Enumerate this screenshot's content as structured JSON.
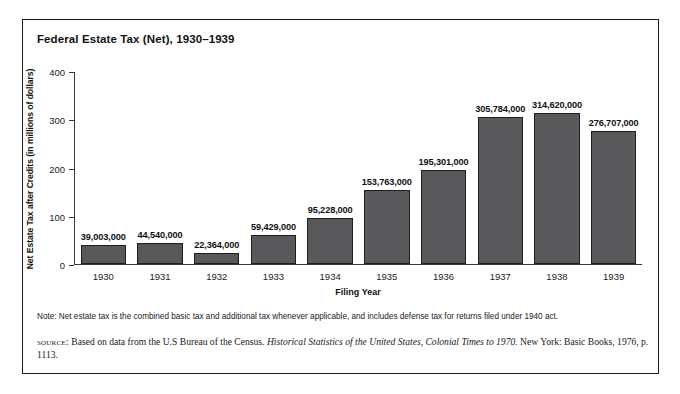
{
  "figure": {
    "title": "Federal Estate Tax (Net), 1930–1939",
    "note": "Note: Net estate tax is the combined basic tax and additional tax whenever applicable, and includes defense tax for returns filed under 1940 act.",
    "source": {
      "label": "source:",
      "text_before_italic": "Based on data from the U.S Bureau of the Census.",
      "italic_title": "Historical Statistics of the United States, Colonial Times to 1970.",
      "text_after_italic": "New York: Basic Books, 1976, p. 1113."
    }
  },
  "colors": {
    "bar_fill": "#59595b",
    "bar_border": "#1e1e1e",
    "axis": "#3a3a3a",
    "frame": "#1a1a1a",
    "text": "#111111"
  },
  "chart_data": {
    "type": "bar",
    "title": "Federal Estate Tax (Net), 1930–1939",
    "xlabel": "Filing Year",
    "ylabel": "Net Estate Tax after Credits (in millions of dollars)",
    "ylim": [
      0,
      400
    ],
    "yticks": [
      0,
      100,
      200,
      300,
      400
    ],
    "ytick_labels": [
      "0",
      "100",
      "200",
      "300",
      "400"
    ],
    "grid": false,
    "legend": null,
    "categories": [
      "1930",
      "1931",
      "1932",
      "1933",
      "1934",
      "1935",
      "1936",
      "1937",
      "1938",
      "1939"
    ],
    "values": [
      39.003,
      44.54,
      22.364,
      59.429,
      95.228,
      153.763,
      195.301,
      305.784,
      314.62,
      276.707
    ],
    "data_labels": [
      "39,003,000",
      "44,540,000",
      "22,364,000",
      "59,429,000",
      "95,228,000",
      "153,763,000",
      "195,301,000",
      "305,784,000",
      "314,620,000",
      "276,707,000"
    ]
  }
}
